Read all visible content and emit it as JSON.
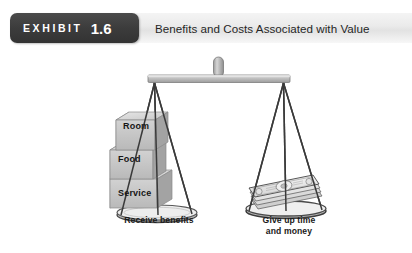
{
  "exhibit": {
    "badge_word": "EXHIBIT",
    "badge_number": "1.6",
    "title": "Benefits and Costs Associated with Value",
    "badge_color": "#3c3c3c",
    "bar_color": "#ebebeb",
    "title_color": "#262626"
  },
  "illustration": {
    "name": "balance-scale-diagram",
    "left_pan": {
      "caption": "Receive benefits",
      "blocks": [
        {
          "label": "Room"
        },
        {
          "label": "Food"
        },
        {
          "label": "Service"
        }
      ]
    },
    "right_pan": {
      "caption_line1": "Give up time",
      "caption_line2": "and money",
      "contents": "stack-of-banknotes"
    },
    "colors": {
      "block_face": "#c9c9c9",
      "block_top": "#dcdcdc",
      "block_side": "#a9a9a9",
      "beam": "#bdbdbd",
      "string": "#3a3a3a",
      "money": "#e8e8e8"
    }
  }
}
